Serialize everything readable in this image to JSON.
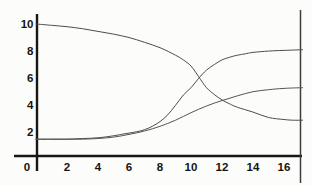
{
  "figure": {
    "background": "#fcfcfb",
    "axis_color": "#161616",
    "border_color": "#3d3d3d",
    "tick_label_color": "#141414"
  },
  "chart_data": {
    "type": "line",
    "grid": false,
    "legend": false,
    "xlim": [
      0,
      17.2
    ],
    "ylim": [
      0,
      10.7
    ],
    "x_ticks": [
      "0",
      "2",
      "4",
      "6",
      "8",
      "10",
      "12",
      "14",
      "16"
    ],
    "x_tick_values": [
      0,
      2,
      4,
      6,
      8,
      10,
      12,
      14,
      16
    ],
    "y_ticks": [
      "2",
      "4",
      "6",
      "8",
      "10"
    ],
    "y_tick_values": [
      2,
      4,
      6,
      8,
      10
    ],
    "frame": {
      "left_axis": true,
      "bottom_axis": true,
      "right_border": true,
      "top_border": false
    },
    "series": [
      {
        "name": "descending-curve",
        "color": "#4d4d4d",
        "width": 1,
        "points": [
          [
            0,
            10.0
          ],
          [
            1,
            9.9
          ],
          [
            2,
            9.8
          ],
          [
            3,
            9.65
          ],
          [
            4,
            9.45
          ],
          [
            5,
            9.25
          ],
          [
            6,
            9.0
          ],
          [
            7,
            8.65
          ],
          [
            8,
            8.25
          ],
          [
            9,
            7.7
          ],
          [
            9.5,
            7.35
          ],
          [
            10,
            6.9
          ],
          [
            10.5,
            6.1
          ],
          [
            11,
            5.3
          ],
          [
            11.5,
            4.8
          ],
          [
            12,
            4.4
          ],
          [
            12.5,
            4.1
          ],
          [
            13,
            3.85
          ],
          [
            14,
            3.5
          ],
          [
            15,
            3.1
          ],
          [
            16,
            2.95
          ],
          [
            16.6,
            2.9
          ],
          [
            17.2,
            2.9
          ]
        ]
      },
      {
        "name": "rising-sigmoid-curve",
        "color": "#4d4d4d",
        "width": 1,
        "points": [
          [
            0,
            1.5
          ],
          [
            1,
            1.5
          ],
          [
            2,
            1.5
          ],
          [
            3,
            1.55
          ],
          [
            4,
            1.6
          ],
          [
            5,
            1.75
          ],
          [
            5.5,
            1.85
          ],
          [
            6,
            1.95
          ],
          [
            6.5,
            2.05
          ],
          [
            7,
            2.2
          ],
          [
            7.5,
            2.45
          ],
          [
            8,
            2.8
          ],
          [
            8.5,
            3.3
          ],
          [
            9,
            4.0
          ],
          [
            9.5,
            4.75
          ],
          [
            10,
            5.3
          ],
          [
            10.5,
            6.0
          ],
          [
            11,
            6.6
          ],
          [
            11.5,
            7.0
          ],
          [
            12,
            7.35
          ],
          [
            12.5,
            7.55
          ],
          [
            13,
            7.7
          ],
          [
            13.5,
            7.8
          ],
          [
            14,
            7.9
          ],
          [
            15,
            8.0
          ],
          [
            16,
            8.05
          ],
          [
            17.2,
            8.1
          ]
        ]
      },
      {
        "name": "rising-plateau-curve",
        "color": "#555555",
        "width": 1,
        "points": [
          [
            0,
            1.5
          ],
          [
            1,
            1.5
          ],
          [
            2,
            1.5
          ],
          [
            3,
            1.5
          ],
          [
            4,
            1.55
          ],
          [
            5,
            1.65
          ],
          [
            6,
            1.85
          ],
          [
            7,
            2.1
          ],
          [
            8,
            2.45
          ],
          [
            9,
            2.9
          ],
          [
            10,
            3.45
          ],
          [
            11,
            3.95
          ],
          [
            12,
            4.35
          ],
          [
            13,
            4.7
          ],
          [
            14,
            5.0
          ],
          [
            15,
            5.15
          ],
          [
            16,
            5.25
          ],
          [
            17.2,
            5.3
          ]
        ]
      }
    ]
  }
}
